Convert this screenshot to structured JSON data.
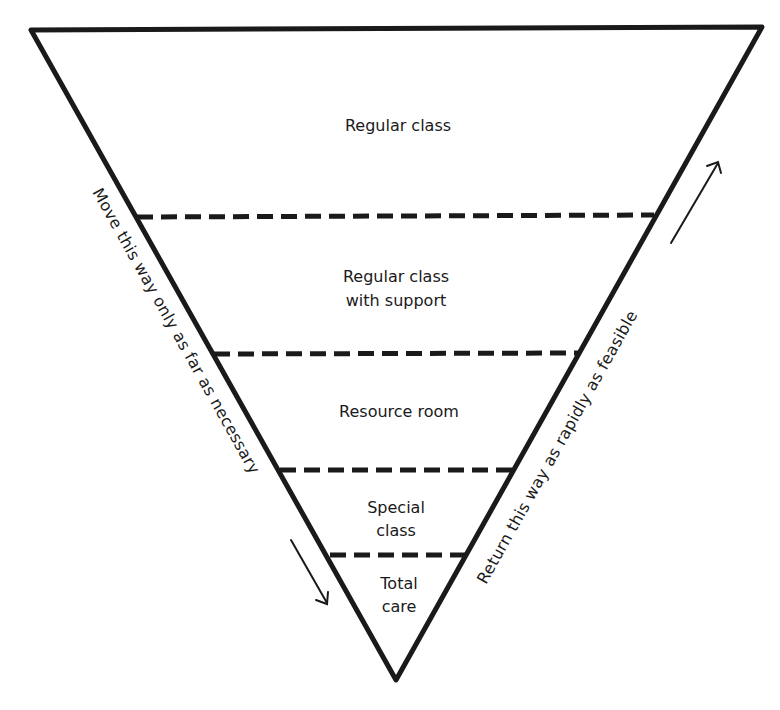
{
  "diagram": {
    "type": "inverted-triangle-cascade",
    "tiers": [
      {
        "lines": [
          "Regular class"
        ]
      },
      {
        "lines": [
          "Regular class",
          "with support"
        ]
      },
      {
        "lines": [
          "Resource room"
        ]
      },
      {
        "lines": [
          "Special",
          "class"
        ]
      },
      {
        "lines": [
          "Total",
          "care"
        ]
      }
    ],
    "left_annotation": "Move this way only as far as necessary",
    "right_annotation": "Return this way as rapidly as feasible",
    "colors": {
      "stroke": "#1a1a1a",
      "background": "#ffffff"
    }
  }
}
